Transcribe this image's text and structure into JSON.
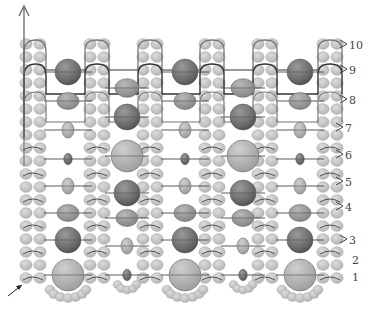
{
  "diagram": {
    "type": "beadwork-pattern",
    "colors": {
      "seed_bead": "#c4c4c4",
      "seed_bead_edge": "#a8a8a8",
      "bead_dark": "#6e6e6e",
      "bead_medium": "#9a9a9a",
      "bead_light": "#b4b4b4",
      "thread_dark": "#333333",
      "thread_light": "#777777"
    },
    "row_labels": [
      {
        "text": "10",
        "x": 349,
        "y": 45,
        "bracket": true
      },
      {
        "text": "9",
        "x": 349,
        "y": 70,
        "bracket": true
      },
      {
        "text": "8",
        "x": 349,
        "y": 100,
        "bracket": true
      },
      {
        "text": "7",
        "x": 345,
        "y": 128,
        "bracket": true
      },
      {
        "text": "6",
        "x": 345,
        "y": 155,
        "bracket": true
      },
      {
        "text": "5",
        "x": 345,
        "y": 182,
        "bracket": true
      },
      {
        "text": "4",
        "x": 345,
        "y": 207,
        "bracket": true
      },
      {
        "text": "3",
        "x": 349,
        "y": 240,
        "bracket": true
      },
      {
        "text": "2",
        "x": 352,
        "y": 260,
        "bracket": false
      },
      {
        "text": "1",
        "x": 352,
        "y": 277,
        "bracket": false
      }
    ],
    "start_arrow": {
      "label": "thread-start",
      "x1": 8,
      "y1": 296,
      "x2": 22,
      "y2": 285
    },
    "exit_arrow": {
      "label": "thread-exit",
      "x": 24,
      "y_top": 6,
      "y_bottom": 135
    },
    "seed_columns_x": [
      33,
      97,
      150,
      212,
      265,
      330
    ],
    "gap_a_x": [
      68,
      185,
      300
    ],
    "gap_b_x": [
      127,
      243
    ],
    "gap_a_beads": [
      {
        "y": 72,
        "r": 13,
        "shade": "dark",
        "shape": "round"
      },
      {
        "y": 101,
        "r": 10,
        "shade": "medium",
        "shape": "oblate"
      },
      {
        "y": 130,
        "r": 7,
        "shade": "light",
        "shape": "oval"
      },
      {
        "y": 159,
        "r": 5,
        "shade": "dark",
        "shape": "oval"
      },
      {
        "y": 186,
        "r": 7,
        "shade": "light",
        "shape": "oval"
      },
      {
        "y": 213,
        "r": 10,
        "shade": "medium",
        "shape": "oblate"
      },
      {
        "y": 240,
        "r": 13,
        "shade": "dark",
        "shape": "round"
      },
      {
        "y": 275,
        "r": 16,
        "shade": "light",
        "shape": "round"
      }
    ],
    "gap_b_beads": [
      {
        "y": 88,
        "r": 11,
        "shade": "medium",
        "shape": "oblate"
      },
      {
        "y": 117,
        "r": 13,
        "shade": "dark",
        "shape": "round"
      },
      {
        "y": 156,
        "r": 16,
        "shade": "light",
        "shape": "round"
      },
      {
        "y": 193,
        "r": 13,
        "shade": "dark",
        "shape": "round"
      },
      {
        "y": 218,
        "r": 10,
        "shade": "medium",
        "shape": "oblate"
      },
      {
        "y": 246,
        "r": 7,
        "shade": "light",
        "shape": "oval"
      },
      {
        "y": 275,
        "r": 5,
        "shade": "dark",
        "shape": "oval"
      }
    ]
  }
}
